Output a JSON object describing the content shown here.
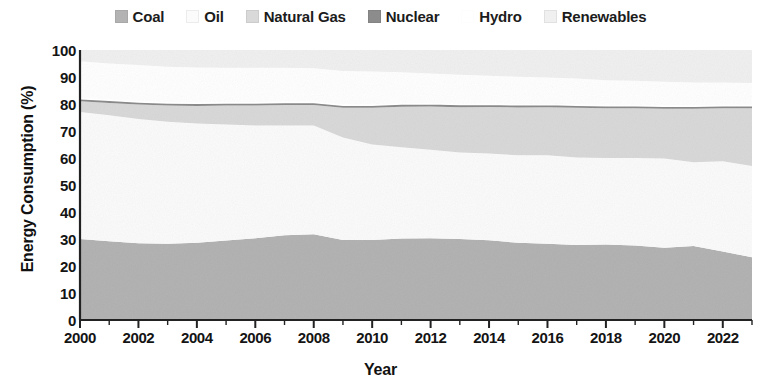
{
  "legend": {
    "position": "top-center",
    "items": [
      {
        "label": "Coal",
        "color": "#b3b3b3",
        "key": "coal"
      },
      {
        "label": "Oil",
        "color": "#fbfbfb",
        "key": "oil"
      },
      {
        "label": "Natural Gas",
        "color": "#d9d9d9",
        "key": "natural_gas"
      },
      {
        "label": "Nuclear",
        "color": "#8c8c8c",
        "key": "nuclear"
      },
      {
        "label": "Hydro",
        "color": "#ffffff",
        "key": "hydro"
      },
      {
        "label": "Renewables",
        "color": "#f0f0f0",
        "key": "renewables"
      }
    ]
  },
  "axes": {
    "x_title": "Year",
    "y_title": "Energy Consumption (%)",
    "y_ticks": [
      "0",
      "10",
      "20",
      "30",
      "40",
      "50",
      "60",
      "70",
      "80",
      "90",
      "100"
    ],
    "x_ticks": [
      "2000",
      "2002",
      "2004",
      "2006",
      "2008",
      "2010",
      "2012",
      "2014",
      "2016",
      "2018",
      "2020",
      "2022"
    ]
  },
  "chart_data": {
    "type": "area",
    "stacked": true,
    "title": "",
    "subtitle": "",
    "xlabel": "Year",
    "ylabel": "Energy Consumption (%)",
    "xlim": [
      2000,
      2023
    ],
    "ylim": [
      0,
      100
    ],
    "grid": false,
    "legend_position": "top-center",
    "x": [
      2000,
      2001,
      2002,
      2003,
      2004,
      2005,
      2006,
      2007,
      2008,
      2009,
      2010,
      2011,
      2012,
      2013,
      2014,
      2015,
      2016,
      2017,
      2018,
      2019,
      2020,
      2021,
      2022,
      2023
    ],
    "series": [
      {
        "name": "Coal",
        "color": "#b3b3b3",
        "values": [
          30.0,
          29.2,
          28.4,
          28.2,
          28.6,
          29.4,
          30.3,
          31.4,
          31.8,
          29.6,
          29.6,
          30.2,
          30.3,
          30.0,
          29.5,
          28.6,
          28.2,
          27.8,
          28.0,
          27.6,
          26.8,
          27.4,
          25.4,
          23.2
        ]
      },
      {
        "name": "Oil",
        "color": "#fbfbfb",
        "values": [
          47.0,
          46.6,
          46.0,
          45.2,
          44.2,
          43.0,
          41.7,
          40.6,
          40.2,
          38.0,
          35.4,
          33.8,
          32.8,
          32.0,
          32.2,
          32.4,
          32.8,
          32.4,
          32.0,
          32.4,
          33.0,
          31.0,
          33.4,
          33.8
        ]
      },
      {
        "name": "Natural Gas",
        "color": "#d9d9d9",
        "values": [
          4.0,
          4.6,
          5.4,
          6.0,
          6.5,
          7.0,
          7.4,
          7.6,
          7.6,
          11.0,
          13.6,
          15.0,
          16.0,
          16.8,
          17.2,
          17.7,
          17.8,
          18.4,
          18.4,
          18.4,
          18.4,
          19.8,
          19.6,
          21.4
        ]
      },
      {
        "name": "Nuclear",
        "color": "#8c8c8c",
        "values": [
          1.0,
          1.0,
          1.0,
          1.0,
          1.0,
          1.0,
          1.0,
          1.0,
          1.0,
          1.0,
          1.0,
          1.0,
          1.0,
          1.0,
          1.0,
          1.0,
          1.0,
          1.0,
          1.0,
          1.0,
          1.0,
          1.0,
          1.0,
          1.0
        ]
      },
      {
        "name": "Hydro",
        "color": "#ffffff",
        "values": [
          13.8,
          13.6,
          13.6,
          13.4,
          13.2,
          13.0,
          13.0,
          12.8,
          12.6,
          12.6,
          12.4,
          11.8,
          11.2,
          11.0,
          10.6,
          10.4,
          10.0,
          9.8,
          9.4,
          9.2,
          9.0,
          8.8,
          8.6,
          8.4
        ]
      },
      {
        "name": "Renewables",
        "color": "#f0f0f0",
        "values": [
          4.2,
          5.0,
          5.6,
          6.2,
          6.5,
          6.6,
          6.6,
          6.6,
          6.8,
          7.8,
          8.0,
          8.2,
          8.7,
          9.2,
          9.5,
          9.9,
          10.2,
          10.6,
          11.2,
          11.4,
          11.8,
          12.0,
          12.0,
          12.2
        ]
      }
    ]
  }
}
